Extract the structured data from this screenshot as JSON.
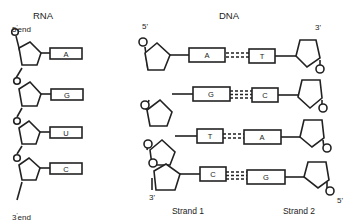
{
  "rna": {
    "title": "RNA",
    "five_end": "5",
    "five_end_suffix": "end",
    "three_end": "3",
    "three_end_suffix": "end",
    "bases": [
      "A",
      "G",
      "U",
      "C"
    ]
  },
  "dna": {
    "title": "DNA",
    "strand1_label": "Strand 1",
    "strand2_label": "Strand 2",
    "strand1_top": "5'",
    "strand1_bottom": "3'",
    "strand2_top": "3'",
    "strand2_bottom": "5'",
    "pairs": [
      {
        "left": "A",
        "right": "T",
        "bonds": 2
      },
      {
        "left": "G",
        "right": "C",
        "bonds": 3
      },
      {
        "left": "T",
        "right": "A",
        "bonds": 2
      },
      {
        "left": "C",
        "right": "G",
        "bonds": 3
      }
    ]
  },
  "colors": {
    "stroke": "#222222",
    "background": "#ffffff"
  }
}
